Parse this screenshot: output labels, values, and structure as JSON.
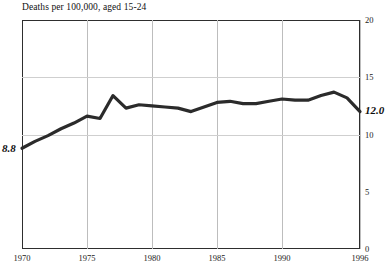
{
  "chart_data": {
    "type": "line",
    "title": "Deaths per 100,000, aged 15-24",
    "xlabel": "",
    "ylabel": "",
    "xlim": [
      1970,
      1996
    ],
    "ylim": [
      0,
      20
    ],
    "grid": "both",
    "legend": "none",
    "x_ticks": [
      "1970",
      "1975",
      "1980",
      "1985",
      "1990",
      "1996"
    ],
    "x_tick_values": [
      1970,
      1975,
      1980,
      1985,
      1990,
      1996
    ],
    "y_ticks": [
      "0",
      "5",
      "10",
      "15",
      "20"
    ],
    "y_tick_values": [
      0,
      5,
      10,
      15,
      20
    ],
    "y_tick_side": "right",
    "gridlines_y": [
      10,
      15
    ],
    "gridlines_x": [
      1975,
      1980,
      1985,
      1990,
      1996
    ],
    "series": [
      {
        "name": "Deaths per 100,000, aged 15-24",
        "color": "#2b2b2b",
        "line_width": 3.2,
        "x": [
          1970,
          1971,
          1972,
          1973,
          1974,
          1975,
          1976,
          1977,
          1978,
          1979,
          1980,
          1981,
          1982,
          1983,
          1984,
          1985,
          1986,
          1987,
          1988,
          1989,
          1990,
          1991,
          1992,
          1993,
          1994,
          1995,
          1996
        ],
        "values": [
          8.8,
          9.4,
          9.9,
          10.5,
          11.0,
          11.6,
          11.4,
          13.4,
          12.3,
          12.6,
          12.5,
          12.4,
          12.3,
          12.0,
          12.4,
          12.8,
          12.9,
          12.7,
          12.7,
          12.9,
          13.1,
          13.0,
          13.0,
          13.4,
          13.7,
          13.2,
          12.0
        ]
      }
    ],
    "annotations": [
      {
        "name": "start-value",
        "text": "8.8",
        "x": 1970,
        "y": 8.8,
        "position": "left"
      },
      {
        "name": "end-value",
        "text": "12.0",
        "x": 1996,
        "y": 12.0,
        "position": "right"
      }
    ]
  },
  "labels": {
    "start_value": "8.8",
    "end_value": "12.0"
  }
}
